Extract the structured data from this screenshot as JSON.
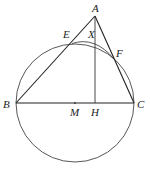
{
  "diagram": {
    "type": "geometry",
    "points": {
      "A": {
        "label": "A",
        "x": 95,
        "y": 16
      },
      "B": {
        "label": "B",
        "x": 16,
        "y": 103
      },
      "C": {
        "label": "C",
        "x": 134,
        "y": 103
      },
      "E": {
        "label": "E",
        "x": 72,
        "y": 44
      },
      "F": {
        "label": "F",
        "x": 114,
        "y": 59
      },
      "X": {
        "label": "X",
        "x": 95,
        "y": 40
      },
      "M": {
        "label": "M",
        "x": 75,
        "y": 103
      },
      "H": {
        "label": "H",
        "x": 95,
        "y": 103
      }
    },
    "circle": {
      "cx": 75,
      "cy": 103,
      "r": 59
    },
    "stroke_color": "#333333"
  }
}
